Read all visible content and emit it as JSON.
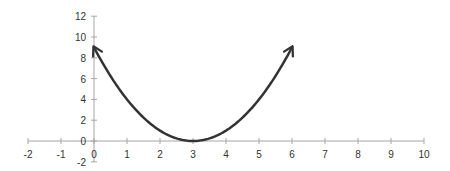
{
  "chart_data": {
    "type": "line",
    "title": "",
    "xlabel": "",
    "ylabel": "",
    "xlim": [
      -2,
      10
    ],
    "ylim": [
      -2,
      12
    ],
    "x_ticks": [
      -2,
      -1,
      0,
      1,
      2,
      3,
      4,
      5,
      6,
      7,
      8,
      9,
      10
    ],
    "y_ticks": [
      -2,
      0,
      2,
      4,
      6,
      8,
      10,
      12
    ],
    "grid": false,
    "legend": null,
    "series": [
      {
        "name": "y = (x-3)^2",
        "x": [
          0,
          0.5,
          1,
          1.5,
          2,
          2.5,
          3,
          3.5,
          4,
          4.5,
          5,
          5.5,
          6
        ],
        "y": [
          9,
          6.25,
          4,
          2.25,
          1,
          0.25,
          0,
          0.25,
          1,
          2.25,
          4,
          6.25,
          9
        ],
        "color": "#333333",
        "arrows_both_ends": true
      }
    ]
  },
  "axis": {
    "x_labels": [
      "-2",
      "-1",
      "0",
      "1",
      "2",
      "3",
      "4",
      "5",
      "6",
      "7",
      "8",
      "9",
      "10"
    ],
    "y_labels": [
      "-2",
      "0",
      "2",
      "4",
      "6",
      "8",
      "10",
      "12"
    ]
  }
}
